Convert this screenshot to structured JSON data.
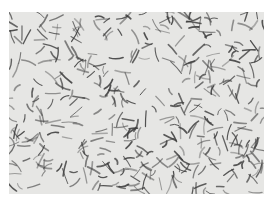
{
  "image": {
    "subject": "micrograph of curved rod-shaped bacteria",
    "background_color": "#e6e6e4",
    "cell_color": "#3c3c3c",
    "frame": {
      "x": 9,
      "y": 12,
      "width": 255,
      "height": 182
    }
  }
}
